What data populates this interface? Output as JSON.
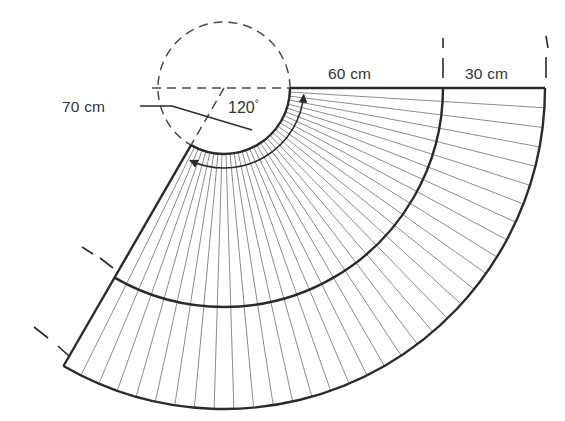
{
  "diagram": {
    "type": "technical-geometry-drawing",
    "background_color": "#ffffff",
    "stroke_color": "#2b2b2b",
    "light_stroke_color": "#8c8c8c",
    "text_color": "#333333",
    "labels": {
      "inner_radius": "70 cm",
      "first_band": "60 cm",
      "second_band": "30 cm",
      "angle": "120",
      "angle_unit": "°",
      "angle_full": "120°"
    },
    "geometry": {
      "center_x": 224,
      "center_y": 88,
      "inner_radius_px": 66,
      "mid_radius_px": 219,
      "outer_radius_px": 321,
      "start_angle_deg": 0,
      "sweep_deg": 120,
      "num_radial_lines": 34,
      "inner_radius_cm": 70,
      "band1_cm": 60,
      "band2_cm": 30,
      "total_radius_cm": 160
    },
    "guide_circle": {
      "cx": 224,
      "cy": 88,
      "r": 66,
      "style": "dashed"
    },
    "dimension_ticks": [
      {
        "name": "tick-60cm-left",
        "x": 290
      },
      {
        "name": "tick-60-30-divider",
        "x": 443
      },
      {
        "name": "tick-30cm-right",
        "x": 545
      }
    ]
  },
  "chart_data": {
    "type": "diagram",
    "annotations": [
      {
        "text": "70 cm",
        "meaning": "inner radius of annular sector"
      },
      {
        "text": "60 cm",
        "meaning": "width of first annular band"
      },
      {
        "text": "30 cm",
        "meaning": "width of second (outer) annular band"
      },
      {
        "text": "120°",
        "meaning": "central angle of sector"
      }
    ],
    "values": [
      70,
      60,
      30,
      120
    ],
    "categories": [
      "inner radius (cm)",
      "band 1 (cm)",
      "band 2 (cm)",
      "angle (deg)"
    ]
  }
}
